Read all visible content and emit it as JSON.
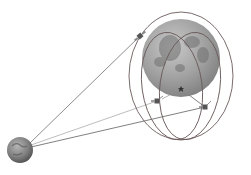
{
  "diagram": {
    "title": "",
    "colors": {
      "background": "#ffffff",
      "orbit": "#6a5a5a",
      "link": "#707070",
      "moon": "#9a9a9a",
      "earth": "#7a7a7a"
    },
    "bodies": [
      {
        "name": "earth",
        "cx": 20,
        "cy": 150,
        "r": 13
      },
      {
        "name": "moon",
        "cx": 181,
        "cy": 58,
        "r": 39
      }
    ],
    "orbits": [
      {
        "name": "outer-orbit",
        "cx": 181,
        "cy": 76,
        "rx": 52,
        "ry": 64
      },
      {
        "name": "inner-orbit-left",
        "cx": 174,
        "cy": 85,
        "rx": 32,
        "ry": 56
      },
      {
        "name": "inner-orbit-right",
        "cx": 188,
        "cy": 85,
        "rx": 32,
        "ry": 56
      }
    ],
    "satellites": [
      {
        "name": "relay-satellite-top",
        "x": 140,
        "y": 36
      },
      {
        "name": "relay-satellite-left",
        "x": 157,
        "y": 101
      },
      {
        "name": "relay-satellite-right",
        "x": 205,
        "y": 107
      },
      {
        "name": "lander",
        "x": 181,
        "y": 89
      }
    ]
  }
}
